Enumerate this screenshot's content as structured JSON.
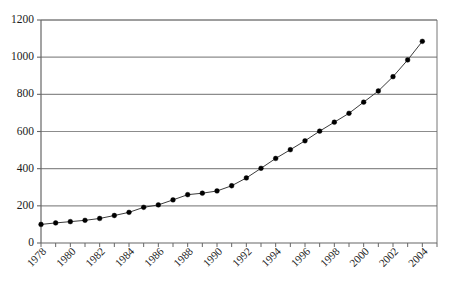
{
  "chart_data": {
    "type": "line",
    "title": "",
    "subtitle": "",
    "xlabel": "",
    "ylabel": "",
    "grid": "horizontal",
    "legend": "none",
    "marker": "filled-circle",
    "line_color": "#3b3b3b",
    "marker_color": "#000000",
    "grid_color": "#8c8c8c",
    "axis_color": "#666666",
    "xlim": [
      1978,
      2005
    ],
    "ylim": [
      0,
      1200
    ],
    "y_ticks": [
      0,
      200,
      400,
      600,
      800,
      1000,
      1200
    ],
    "y_tick_labels": [
      "0",
      "200",
      "400",
      "600",
      "800",
      "1000",
      "1200"
    ],
    "x_ticks": [
      1978,
      1979,
      1980,
      1981,
      1982,
      1983,
      1984,
      1985,
      1986,
      1987,
      1988,
      1989,
      1990,
      1991,
      1992,
      1993,
      1994,
      1995,
      1996,
      1997,
      1998,
      1999,
      2000,
      2001,
      2002,
      2003,
      2004,
      2005
    ],
    "x_tick_labels": [
      "1978",
      "1980",
      "1982",
      "1984",
      "1986",
      "1988",
      "1990",
      "1992",
      "1994",
      "1996",
      "1998",
      "2000",
      "2002",
      "2004"
    ],
    "x_tick_label_years": [
      1978,
      1980,
      1982,
      1984,
      1986,
      1988,
      1990,
      1992,
      1994,
      1996,
      1998,
      2000,
      2002,
      2004
    ],
    "x_tick_label_rotation": -45,
    "x": [
      1978,
      1979,
      1980,
      1981,
      1982,
      1983,
      1984,
      1985,
      1986,
      1987,
      1988,
      1989,
      1990,
      1991,
      1992,
      1993,
      1994,
      1995,
      1996,
      1997,
      1998,
      1999,
      2000,
      2001,
      2002,
      2003,
      2004
    ],
    "y": [
      100,
      108,
      115,
      122,
      132,
      148,
      165,
      192,
      205,
      232,
      260,
      268,
      280,
      308,
      350,
      402,
      455,
      502,
      550,
      602,
      650,
      698,
      758,
      818,
      895,
      985,
      1085
    ],
    "series": [
      {
        "name": "",
        "values": [
          100,
          108,
          115,
          122,
          132,
          148,
          165,
          192,
          205,
          232,
          260,
          268,
          280,
          308,
          350,
          402,
          455,
          502,
          550,
          602,
          650,
          698,
          758,
          818,
          895,
          985,
          1085
        ]
      }
    ]
  }
}
